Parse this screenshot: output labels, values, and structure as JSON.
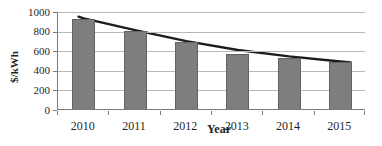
{
  "figure": {
    "background": "#ffffff"
  },
  "chart_data": {
    "type": "bar",
    "title": "",
    "xlabel": "Year",
    "ylabel": "$/kWh",
    "categories": [
      "2010",
      "2011",
      "2012",
      "2013",
      "2014",
      "2015"
    ],
    "series": [
      {
        "name": "$/kWh",
        "values": [
          920,
          800,
          680,
          560,
          520,
          480
        ]
      }
    ],
    "trendline": {
      "style": "power-fit",
      "points_category_value": [
        [
          -0.1,
          952
        ],
        [
          0,
          935
        ],
        [
          1,
          815
        ],
        [
          2,
          703
        ],
        [
          3,
          612
        ],
        [
          4,
          547
        ],
        [
          5,
          495
        ],
        [
          5.2,
          487
        ]
      ]
    },
    "ylim": [
      0,
      1000
    ],
    "yticks": [
      0,
      200,
      400,
      600,
      800,
      1000
    ],
    "grid": true,
    "legend": false,
    "colors": {
      "bar_fill": "#7e7e7e",
      "bar_border": "#636363",
      "gridline": "#b8b8b8",
      "axis": "#7a7a7a",
      "trend": "#1c1c1c",
      "text": "#1f1f1f"
    }
  }
}
